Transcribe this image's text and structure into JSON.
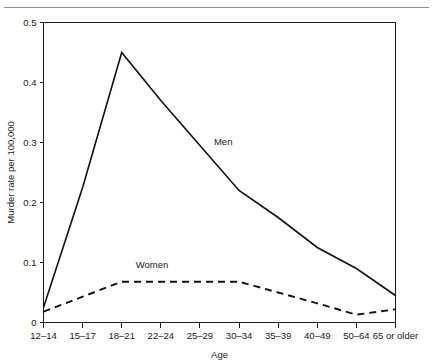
{
  "figure": {
    "ghost_header": "",
    "axis": {
      "x_title": "Age",
      "y_title": "Murder rate per 100,000",
      "y_ticks": [
        "0",
        "0.1",
        "0.2",
        "0.3",
        "0.4",
        "0.5"
      ],
      "x_ticks": [
        "12–14",
        "15–17",
        "18–21",
        "22–24",
        "25–29",
        "30–34",
        "35–39",
        "40–49",
        "50–64",
        "65 or older"
      ]
    },
    "series_labels": {
      "men": "Men",
      "women": "Women"
    }
  },
  "chart_data": {
    "type": "line",
    "title": "",
    "subtitle": "",
    "xlabel": "Age",
    "ylabel": "Murder rate per 100,000",
    "categories": [
      "12–14",
      "15–17",
      "18–21",
      "22–24",
      "25–29",
      "30–34",
      "35–39",
      "40–49",
      "50–64",
      "65 or older"
    ],
    "ylim": [
      0,
      0.5
    ],
    "yticks": [
      0,
      0.1,
      0.2,
      0.3,
      0.4,
      0.5
    ],
    "grid": false,
    "legend": "inline-labels",
    "annotations": [
      {
        "text": "Men",
        "category": "25–29",
        "value": 0.29
      },
      {
        "text": "Women",
        "category": "18–21",
        "value": 0.085
      }
    ],
    "series": [
      {
        "name": "Men",
        "style": "solid",
        "color": "#111111",
        "values": [
          0.025,
          0.225,
          0.45,
          0.37,
          0.295,
          0.22,
          0.175,
          0.125,
          0.09,
          0.045
        ]
      },
      {
        "name": "Women",
        "style": "dashed",
        "color": "#111111",
        "values": [
          0.018,
          0.043,
          0.068,
          0.068,
          0.068,
          0.068,
          0.05,
          0.032,
          0.013,
          0.022
        ]
      }
    ]
  }
}
